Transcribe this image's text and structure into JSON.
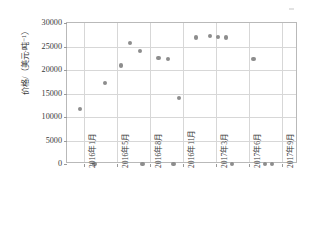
{
  "chart_data": {
    "type": "scatter",
    "title": "",
    "xlabel": "",
    "ylabel": "价格/（美元·吨⁻¹）",
    "ylim": [
      0,
      30000
    ],
    "yticks": [
      0,
      5000,
      10000,
      15000,
      20000,
      25000,
      30000
    ],
    "ytick_labels": [
      "0",
      "5000",
      "10000",
      "15000",
      "20000",
      "25000",
      "30000"
    ],
    "xtick_labels": [
      "2016年1月",
      "2016年5月",
      "2016年8月",
      "2016年11月",
      "2017年3月",
      "2017年6月",
      "2017年9月"
    ],
    "xlim": [
      0,
      26
    ],
    "grid": true,
    "legend": false,
    "marker_color": "#8d8d8d",
    "grid_color": "#d7d7d7",
    "axis_color": "#b9b9b9",
    "points": [
      {
        "x": 1.45,
        "y": 11700
      },
      {
        "x": 3.1,
        "y": 0
      },
      {
        "x": 4.3,
        "y": 17200
      },
      {
        "x": 6.1,
        "y": 21000
      },
      {
        "x": 7.1,
        "y": 25800
      },
      {
        "x": 8.2,
        "y": 24000
      },
      {
        "x": 8.5,
        "y": 0
      },
      {
        "x": 10.3,
        "y": 22500
      },
      {
        "x": 11.4,
        "y": 22400
      },
      {
        "x": 12.0,
        "y": 0
      },
      {
        "x": 12.6,
        "y": 14000
      },
      {
        "x": 14.5,
        "y": 26900
      },
      {
        "x": 16.1,
        "y": 27200
      },
      {
        "x": 17.0,
        "y": 27000
      },
      {
        "x": 17.9,
        "y": 26900
      },
      {
        "x": 18.6,
        "y": 0
      },
      {
        "x": 21.0,
        "y": 22400
      },
      {
        "x": 22.3,
        "y": 0
      },
      {
        "x": 23.1,
        "y": 0
      }
    ]
  }
}
